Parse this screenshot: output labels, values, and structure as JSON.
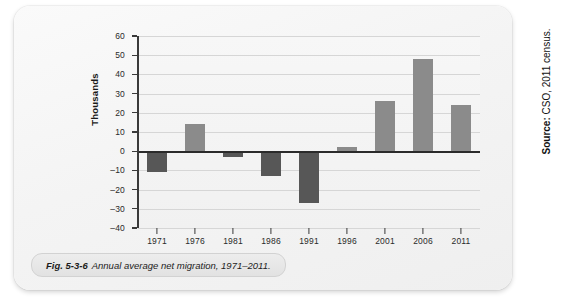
{
  "figure": {
    "caption_number": "Fig. 5-3-6",
    "caption_text": "Annual average net migration, 1971–2011."
  },
  "source": {
    "label": "Source:",
    "text": " CSO, 2011 census."
  },
  "colors": {
    "positive_bar": "#8b8b8b",
    "negative_bar": "#575757",
    "axis": "#2b2b2b",
    "gridline": "#d6d6d6",
    "panel_background": "#f4f4f4"
  },
  "chart_data": {
    "type": "bar",
    "title": "Annual average net migration, 1971–2011.",
    "xlabel": "",
    "ylabel": "Thousands",
    "categories": [
      "1971",
      "1976",
      "1981",
      "1986",
      "1991",
      "1996",
      "2001",
      "2006",
      "2011"
    ],
    "values": [
      -11,
      14,
      -3,
      -13,
      -27,
      2,
      26,
      48,
      24
    ],
    "ylim": [
      -40,
      60
    ],
    "yticks": [
      60,
      50,
      40,
      30,
      20,
      10,
      0,
      -10,
      -20,
      -30,
      -40
    ],
    "ytick_labels": [
      "60",
      "50",
      "40",
      "30",
      "20",
      "10",
      "0",
      "–10",
      "–20",
      "–30",
      "–40"
    ],
    "grid": true,
    "legend": null
  }
}
